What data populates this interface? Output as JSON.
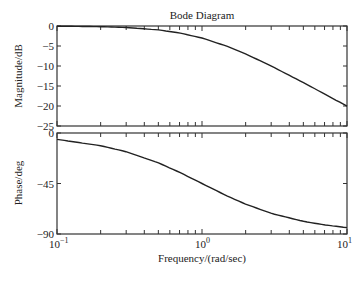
{
  "title": "Bode Diagram",
  "chart_data": [
    {
      "type": "line",
      "title": "Bode Diagram",
      "panel": "magnitude",
      "xlabel": "Frequency/(rad/sec)",
      "ylabel": "Magnitude/dB",
      "xscale": "log",
      "xlim": [
        0.1,
        10
      ],
      "ylim": [
        -25,
        0
      ],
      "yticks": [
        0,
        -5,
        -10,
        -15,
        -20,
        -25
      ],
      "ytick_labels": [
        "0",
        "-5",
        "-10",
        "-15",
        "-20",
        "-25"
      ],
      "grid": false,
      "series": [
        {
          "name": "magnitude",
          "x": [
            0.1,
            0.2,
            0.3,
            0.5,
            0.7,
            1.0,
            1.5,
            2.0,
            3.0,
            5.0,
            7.0,
            10.0
          ],
          "y": [
            -0.04,
            -0.17,
            -0.37,
            -0.97,
            -1.74,
            -3.01,
            -5.12,
            -6.99,
            -10.0,
            -14.15,
            -17.0,
            -20.04
          ]
        }
      ]
    },
    {
      "type": "line",
      "panel": "phase",
      "xlabel": "Frequency/(rad/sec)",
      "ylabel": "Phase/deg",
      "xscale": "log",
      "xlim": [
        0.1,
        10
      ],
      "ylim": [
        -90,
        0
      ],
      "yticks": [
        0,
        -45,
        -90
      ],
      "ytick_labels": [
        "0",
        "-45",
        "-90"
      ],
      "xticks": [
        0.1,
        1,
        10
      ],
      "xtick_labels": [
        "10^-1",
        "10^0",
        "10^1"
      ],
      "grid": false,
      "series": [
        {
          "name": "phase",
          "x": [
            0.1,
            0.2,
            0.3,
            0.5,
            0.7,
            1.0,
            1.5,
            2.0,
            3.0,
            5.0,
            7.0,
            10.0
          ],
          "y": [
            -5.7,
            -11.3,
            -16.7,
            -26.6,
            -35.0,
            -45.0,
            -56.3,
            -63.4,
            -71.6,
            -78.7,
            -81.9,
            -84.3
          ]
        }
      ]
    }
  ],
  "labels": {
    "title": "Bode Diagram",
    "mag_ylabel": "Magnitude/dB",
    "phase_ylabel": "Phase/deg",
    "xlabel": "Frequency/(rad/sec)",
    "x_base": "10",
    "x_exp": [
      "−1",
      "0",
      "1"
    ]
  }
}
